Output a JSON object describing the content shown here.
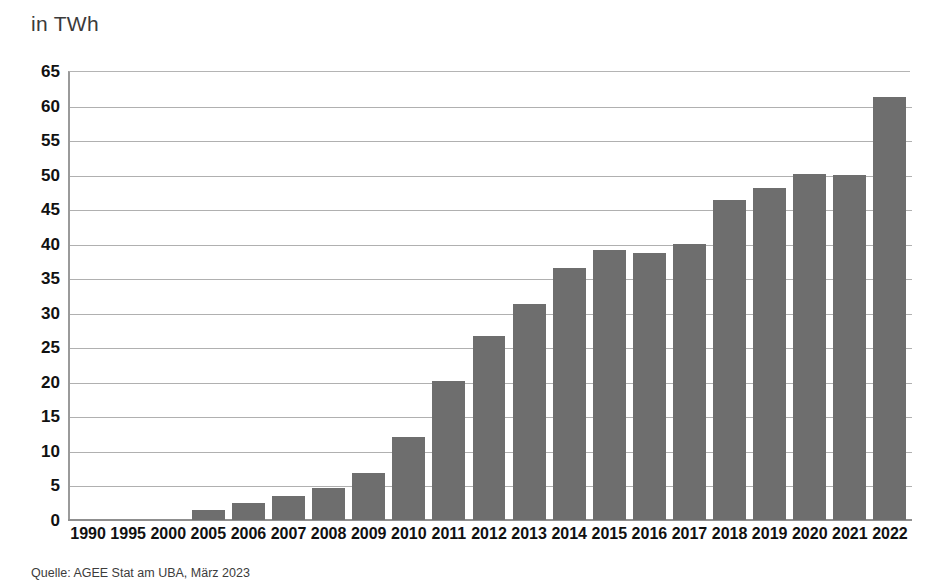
{
  "title": "in TWh",
  "source_note": "Quelle: AGEE Stat am UBA, März 2023",
  "colors": {
    "bar": "#6e6e6e",
    "gridline": "#b0b0b0",
    "axis": "#8f8f8f",
    "text": "#111111",
    "title_text": "#3a3a3a"
  },
  "chart_data": {
    "type": "bar",
    "title": "in TWh",
    "xlabel": "",
    "ylabel": "in TWh",
    "ylim": [
      0,
      65
    ],
    "ytick_step": 5,
    "yticks": [
      0,
      5,
      10,
      15,
      20,
      25,
      30,
      35,
      40,
      45,
      50,
      55,
      60,
      65
    ],
    "grid": true,
    "legend": "none",
    "categories": [
      "1990",
      "1995",
      "2000",
      "2005",
      "2006",
      "2007",
      "2008",
      "2009",
      "2010",
      "2011",
      "2012",
      "2013",
      "2014",
      "2015",
      "2016",
      "2017",
      "2018",
      "2019",
      "2020",
      "2021",
      "2022"
    ],
    "values": [
      0,
      0,
      0,
      1.5,
      2.5,
      3.5,
      4.6,
      6.8,
      12.0,
      20.1,
      26.6,
      31.3,
      36.5,
      39.1,
      38.7,
      39.9,
      46.3,
      48.1,
      50.1,
      49.9,
      61.3
    ],
    "annotations": [
      "Quelle: AGEE Stat am UBA, März 2023"
    ]
  }
}
